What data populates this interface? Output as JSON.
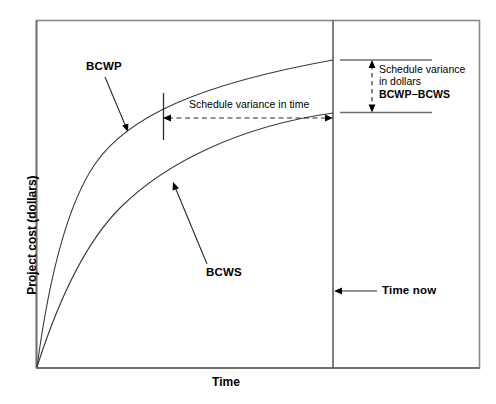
{
  "figure": {
    "type": "earned-value-management-diagram",
    "axes": {
      "y_label": "Project cost (dollars)",
      "x_label": "Time"
    },
    "curves": [
      {
        "name": "BCWP",
        "label": "BCWP",
        "description": "upper concave-down cumulative cost curve"
      },
      {
        "name": "BCWS",
        "label": "BCWS",
        "description": "lower concave-down cumulative cost curve"
      }
    ],
    "annotations": {
      "schedule_variance_time": "Schedule variance in time",
      "schedule_variance_dollars_line1": "Schedule variance",
      "schedule_variance_dollars_line2": "in dollars",
      "schedule_variance_dollars_line3": "BCWP−BCWS",
      "time_now": "Time now"
    },
    "colors": {
      "line": "#000000",
      "frame": "#808080",
      "background": "#ffffff"
    }
  }
}
